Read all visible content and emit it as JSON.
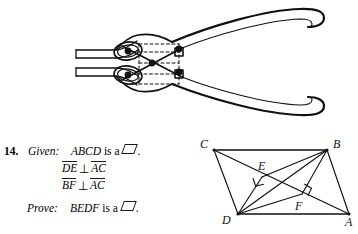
{
  "page": {
    "background": "#ffffff",
    "ink": "#111111"
  },
  "pliers_figure": {
    "name": "pliers-line-drawing",
    "description": "Line drawing of a pair of pliers shown open, with three pivot dots and dashed construction rectangle",
    "pivot_dots": 4,
    "dashed_guides": 2
  },
  "problem": {
    "number": "14.",
    "given_label": "Given:",
    "given_subject": "ABCD",
    "given_is_a": "is a",
    "given_period": ".",
    "condition_1": {
      "segment_a": "DE",
      "relation": "⊥",
      "segment_b": "AC"
    },
    "condition_2": {
      "segment_a": "BF",
      "relation": "⊥",
      "segment_b": "AC"
    },
    "prove_label": "Prove:",
    "prove_subject": "BEDF",
    "prove_is_a": "is a",
    "prove_period": ".",
    "parallelogram_symbol": "▱"
  },
  "geometry_figure": {
    "type": "parallelogram-with-altitudes",
    "vertices": [
      {
        "label": "C",
        "x": 18,
        "y": 18,
        "label_x": 4,
        "label_y": 16
      },
      {
        "label": "B",
        "x": 131,
        "y": 18,
        "label_x": 138,
        "label_y": 16
      },
      {
        "label": "D",
        "x": 42,
        "y": 82,
        "label_x": 27,
        "label_y": 90
      },
      {
        "label": "A",
        "x": 153,
        "y": 82,
        "label_x": 150,
        "label_y": 92
      }
    ],
    "feet": [
      {
        "label": "E",
        "x": 66,
        "y": 45,
        "label_x": 64,
        "label_y": 37
      },
      {
        "label": "F",
        "x": 106,
        "y": 62,
        "label_x": 100,
        "label_y": 76
      }
    ],
    "right_angle_marks": [
      {
        "at": "E",
        "x": 66,
        "y": 45
      },
      {
        "at": "F",
        "x": 106,
        "y": 62
      }
    ],
    "edges": [
      "C-B",
      "B-A",
      "A-D",
      "D-C",
      "A-C",
      "B-D",
      "D-E",
      "B-F",
      "E-D",
      "F-B"
    ]
  }
}
